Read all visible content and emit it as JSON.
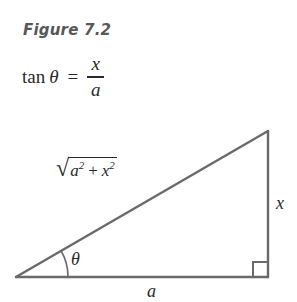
{
  "figure": {
    "caption": "Figure 7.2"
  },
  "formula": {
    "function_name": "tan",
    "angle_symbol": "θ",
    "equals": "=",
    "numerator": "x",
    "denominator": "a",
    "full_text": "tan θ = x / a"
  },
  "diagram": {
    "type": "right-triangle",
    "line_color": "#6a6a6a",
    "text_color": "#2a2a2a",
    "caption_color": "#585858",
    "labels": {
      "hypotenuse_radical": "√",
      "hypotenuse_base_1": "a",
      "hypotenuse_exp_1": "2",
      "hypotenuse_plus": "+",
      "hypotenuse_base_2": "x",
      "hypotenuse_exp_2": "2",
      "hypotenuse_text": "√(a² + x²)",
      "opposite_side": "x",
      "adjacent_side": "a",
      "angle": "θ",
      "right_angle_marker": "right-angle-square"
    },
    "geometry": {
      "vertex_left": [
        16,
        167
      ],
      "vertex_right": [
        268,
        167
      ],
      "vertex_apex": [
        268,
        21
      ],
      "right_angle_square_size": 15,
      "angle_arc_radius": 52
    }
  }
}
